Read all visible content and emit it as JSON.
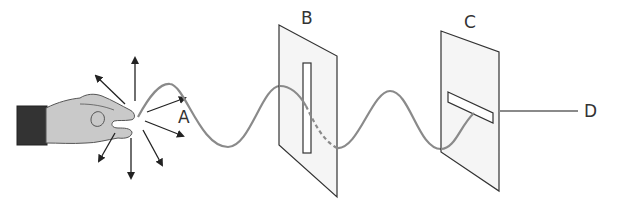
{
  "figure": {
    "labels": {
      "A": "A",
      "B": "B",
      "C": "C",
      "D": "D"
    },
    "colors": {
      "wave": "#8a8a8a",
      "panel_fill": "#f4f4f4",
      "panel_stroke": "#333333",
      "hand_fill": "#c9c9c9",
      "cuff_fill": "#333333",
      "arrow": "#222222",
      "text": "#333333"
    },
    "elements": [
      {
        "id": "hand",
        "label": "",
        "role": "source of vibration in all directions"
      },
      {
        "id": "A",
        "label": "A",
        "role": "unpolarized wave on rope with arrows in many directions"
      },
      {
        "id": "B",
        "label": "B",
        "role": "barrier with vertical slit"
      },
      {
        "id": "C",
        "label": "C",
        "role": "barrier with horizontal slit"
      },
      {
        "id": "D",
        "label": "D",
        "role": "rope beyond C with no wave"
      }
    ]
  }
}
